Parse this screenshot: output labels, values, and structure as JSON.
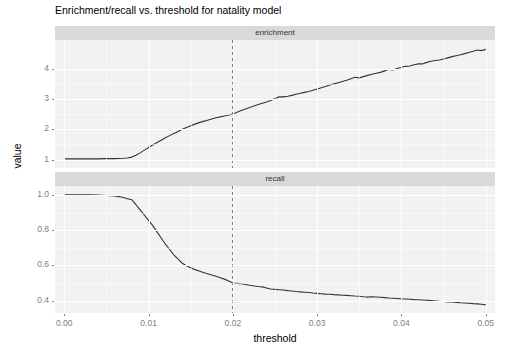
{
  "chart_data": {
    "type": "line",
    "title": "Enrichment/recall vs. threshold for natality model",
    "xlabel": "threshold",
    "ylabel": "value",
    "grid": true,
    "legend": "none",
    "facets": [
      {
        "label": "enrichment",
        "ylim": [
          0.72,
          4.95
        ],
        "yticks": [
          "1",
          "2",
          "3",
          "4"
        ],
        "ytick_values": [
          1,
          2,
          3,
          4
        ],
        "annotation_vline": 0.02,
        "series": [
          {
            "name": "enrichment",
            "x": [
              0.0,
              0.001,
              0.002,
              0.003,
              0.004,
              0.005,
              0.006,
              0.007,
              0.0075,
              0.008,
              0.0085,
              0.009,
              0.0095,
              0.01,
              0.0105,
              0.011,
              0.0115,
              0.012,
              0.0125,
              0.013,
              0.0135,
              0.014,
              0.0145,
              0.015,
              0.0155,
              0.016,
              0.0165,
              0.017,
              0.0175,
              0.018,
              0.0185,
              0.019,
              0.0195,
              0.02,
              0.0205,
              0.021,
              0.0215,
              0.022,
              0.0225,
              0.023,
              0.0235,
              0.024,
              0.0245,
              0.025,
              0.0255,
              0.026,
              0.0265,
              0.027,
              0.0275,
              0.028,
              0.0285,
              0.029,
              0.0295,
              0.03,
              0.0305,
              0.031,
              0.0315,
              0.032,
              0.0325,
              0.033,
              0.0335,
              0.034,
              0.0345,
              0.035,
              0.0355,
              0.036,
              0.0365,
              0.037,
              0.0375,
              0.038,
              0.0385,
              0.039,
              0.0395,
              0.04,
              0.0405,
              0.041,
              0.0415,
              0.042,
              0.0425,
              0.043,
              0.0435,
              0.044,
              0.0445,
              0.045,
              0.0455,
              0.046,
              0.0465,
              0.047,
              0.0475,
              0.048,
              0.0485,
              0.049,
              0.0495,
              0.05
            ],
            "y": [
              1.02,
              1.02,
              1.02,
              1.02,
              1.02,
              1.03,
              1.03,
              1.04,
              1.05,
              1.08,
              1.14,
              1.22,
              1.31,
              1.4,
              1.48,
              1.56,
              1.64,
              1.72,
              1.79,
              1.86,
              1.93,
              2.0,
              2.06,
              2.12,
              2.17,
              2.22,
              2.26,
              2.3,
              2.34,
              2.38,
              2.41,
              2.44,
              2.47,
              2.5,
              2.56,
              2.62,
              2.67,
              2.72,
              2.77,
              2.82,
              2.86,
              2.9,
              2.95,
              3.02,
              3.07,
              3.07,
              3.09,
              3.12,
              3.16,
              3.19,
              3.22,
              3.25,
              3.29,
              3.33,
              3.37,
              3.41,
              3.46,
              3.5,
              3.54,
              3.58,
              3.62,
              3.67,
              3.72,
              3.7,
              3.74,
              3.78,
              3.82,
              3.85,
              3.88,
              3.93,
              3.98,
              3.96,
              4.01,
              4.05,
              4.08,
              4.09,
              4.13,
              4.16,
              4.16,
              4.21,
              4.25,
              4.27,
              4.29,
              4.32,
              4.36,
              4.4,
              4.43,
              4.46,
              4.5,
              4.54,
              4.58,
              4.62,
              4.6,
              4.64,
              4.68
            ]
          }
        ]
      },
      {
        "label": "recall",
        "ylim": [
          0.33,
          1.05
        ],
        "yticks": [
          "0.4",
          "0.6",
          "0.8",
          "1.0"
        ],
        "ytick_values": [
          0.4,
          0.6,
          0.8,
          1.0
        ],
        "annotation_vline": 0.02,
        "series": [
          {
            "name": "recall",
            "x": [
              0.0,
              0.001,
              0.002,
              0.003,
              0.004,
              0.005,
              0.006,
              0.0065,
              0.007,
              0.0075,
              0.008,
              0.0085,
              0.009,
              0.0095,
              0.01,
              0.0105,
              0.011,
              0.0115,
              0.012,
              0.0125,
              0.013,
              0.0135,
              0.014,
              0.0145,
              0.015,
              0.0155,
              0.016,
              0.0165,
              0.017,
              0.0175,
              0.018,
              0.0185,
              0.019,
              0.0195,
              0.02,
              0.0205,
              0.021,
              0.0215,
              0.022,
              0.0225,
              0.023,
              0.0235,
              0.024,
              0.0245,
              0.025,
              0.0255,
              0.026,
              0.0265,
              0.027,
              0.0275,
              0.028,
              0.0285,
              0.029,
              0.0295,
              0.03,
              0.0305,
              0.031,
              0.0315,
              0.032,
              0.0325,
              0.033,
              0.0335,
              0.034,
              0.0345,
              0.035,
              0.0355,
              0.036,
              0.0365,
              0.037,
              0.0375,
              0.038,
              0.0385,
              0.039,
              0.0395,
              0.04,
              0.0405,
              0.041,
              0.0415,
              0.042,
              0.0425,
              0.043,
              0.0435,
              0.044,
              0.0445,
              0.045,
              0.0455,
              0.046,
              0.0465,
              0.047,
              0.0475,
              0.048,
              0.0485,
              0.049,
              0.0495,
              0.05
            ],
            "y": [
              1.0,
              1.0,
              1.0,
              1.0,
              0.998,
              0.996,
              0.993,
              0.99,
              0.985,
              0.978,
              0.972,
              0.945,
              0.915,
              0.885,
              0.855,
              0.825,
              0.79,
              0.755,
              0.72,
              0.69,
              0.66,
              0.635,
              0.612,
              0.598,
              0.586,
              0.576,
              0.568,
              0.56,
              0.552,
              0.545,
              0.538,
              0.53,
              0.522,
              0.512,
              0.5,
              0.498,
              0.496,
              0.492,
              0.487,
              0.483,
              0.48,
              0.478,
              0.472,
              0.466,
              0.464,
              0.462,
              0.46,
              0.457,
              0.455,
              0.452,
              0.45,
              0.448,
              0.446,
              0.443,
              0.441,
              0.439,
              0.437,
              0.436,
              0.434,
              0.433,
              0.431,
              0.43,
              0.428,
              0.426,
              0.425,
              0.422,
              0.42,
              0.422,
              0.421,
              0.419,
              0.417,
              0.415,
              0.414,
              0.412,
              0.41,
              0.409,
              0.408,
              0.406,
              0.405,
              0.404,
              0.402,
              0.4,
              0.398,
              0.396,
              0.395,
              0.393,
              0.392,
              0.39,
              0.388,
              0.387,
              0.385,
              0.383,
              0.382,
              0.38,
              0.376
            ]
          }
        ]
      }
    ],
    "xlim": [
      -0.0011,
      0.0511
    ],
    "xticks": [
      "0.00",
      "0.01",
      "0.02",
      "0.03",
      "0.04",
      "0.05"
    ],
    "xtick_values": [
      0.0,
      0.01,
      0.02,
      0.03,
      0.04,
      0.05
    ],
    "colors": {
      "line": "#333333",
      "panel_background": "#f2f2f2",
      "strip_background": "#d9d9d9",
      "grid": "#ffffff",
      "axis_text": "#808080",
      "vline": "#4d4d4d"
    }
  }
}
